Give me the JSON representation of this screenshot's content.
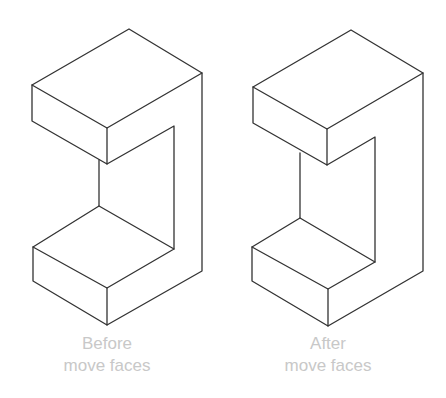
{
  "figure": {
    "type": "isometric before/after comparison",
    "stroke_color": "#333333",
    "caption_color": "#c8c8c8"
  },
  "panels": [
    {
      "id": "before",
      "caption_line1": "Before",
      "caption_line2": "move faces"
    },
    {
      "id": "after",
      "caption_line1": "After",
      "caption_line2": "move faces"
    }
  ]
}
